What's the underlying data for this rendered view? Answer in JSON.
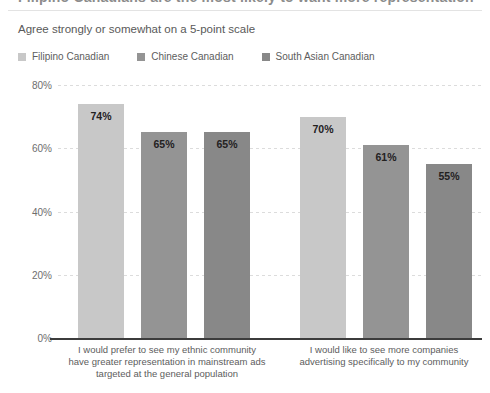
{
  "header": {
    "title": "Filipino Canadians are the most likely to want more representation",
    "subtitle": "Agree strongly or somewhat on a 5-point scale"
  },
  "legend": {
    "items": [
      {
        "label": "Filipino Canadian",
        "color": "#c8c8c8"
      },
      {
        "label": "Chinese Canadian",
        "color": "#949494"
      },
      {
        "label": "South Asian Canadian",
        "color": "#888888"
      }
    ]
  },
  "yaxis": {
    "ticks": [
      "80%",
      "60%",
      "40%",
      "20%",
      "0%"
    ]
  },
  "chart_data": {
    "type": "bar",
    "title": "Filipino Canadians are the most likely to want more representation",
    "subtitle": "Agree strongly or somewhat on a 5-point scale",
    "xlabel": "",
    "ylabel": "",
    "ylim": [
      0,
      80
    ],
    "ytick_values": [
      0,
      20,
      40,
      60,
      80
    ],
    "grid": true,
    "legend_position": "top-left",
    "categories": [
      "I would prefer to see my ethnic community have greater representation in mainstream ads targeted at the general population",
      "I would like to see more companies advertising specifically to my community"
    ],
    "category_lines": [
      [
        "I would prefer to see my ethnic community",
        "have greater representation in mainstream ads",
        "targeted at the general population"
      ],
      [
        "I would like to see more companies",
        "advertising specifically to my community"
      ]
    ],
    "series": [
      {
        "name": "Filipino Canadian",
        "color": "#c8c8c8",
        "values": [
          74,
          70
        ],
        "labels": [
          "74%",
          "70%"
        ]
      },
      {
        "name": "Chinese Canadian",
        "color": "#949494",
        "values": [
          65,
          61
        ],
        "labels": [
          "65%",
          "61%"
        ]
      },
      {
        "name": "South Asian Canadian",
        "color": "#888888",
        "values": [
          65,
          55
        ],
        "labels": [
          "65%",
          "55%"
        ]
      }
    ]
  }
}
